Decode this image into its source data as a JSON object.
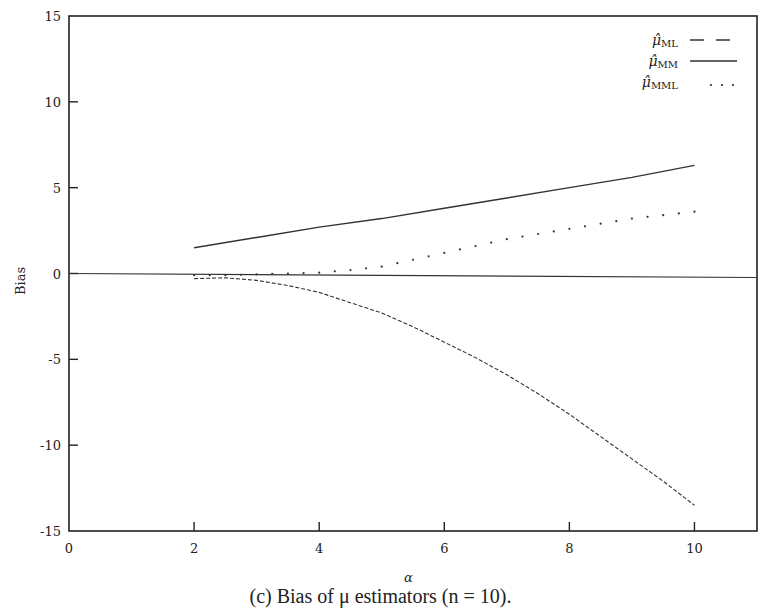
{
  "chart_data": {
    "type": "line",
    "title": "",
    "caption": "(c) Bias of μ estimators (n = 10).",
    "xlabel": "α",
    "ylabel": "Bias",
    "xlim": [
      0,
      11
    ],
    "ylim": [
      -15,
      15
    ],
    "xticks": [
      0,
      2,
      4,
      6,
      8,
      10
    ],
    "yticks": [
      15,
      10,
      5,
      0,
      -5,
      -10,
      -15
    ],
    "grid": false,
    "legend_position": "top-right",
    "reference_line": {
      "y": 0,
      "style": "solid"
    },
    "series": [
      {
        "name": "μ̂_ML",
        "label_base": "μ̂",
        "label_sub": "ML",
        "style": "dashed",
        "x": [
          2,
          2.5,
          3,
          3.5,
          4,
          4.5,
          5,
          5.5,
          6,
          6.5,
          7,
          7.5,
          8,
          8.5,
          9,
          9.5,
          10
        ],
        "values": [
          -0.3,
          -0.25,
          -0.4,
          -0.7,
          -1.1,
          -1.7,
          -2.3,
          -3.1,
          -4.0,
          -4.9,
          -5.9,
          -7.0,
          -8.2,
          -9.5,
          -10.8,
          -12.1,
          -13.5
        ]
      },
      {
        "name": "μ̂_MM",
        "label_base": "μ̂",
        "label_sub": "MM",
        "style": "solid",
        "x": [
          2,
          3,
          4,
          5,
          6,
          7,
          8,
          9,
          10
        ],
        "values": [
          1.5,
          2.1,
          2.7,
          3.2,
          3.8,
          4.4,
          5.0,
          5.6,
          6.3
        ]
      },
      {
        "name": "μ̂_MML",
        "label_base": "μ̂",
        "label_sub": "MML",
        "style": "dotted",
        "x": [
          2,
          2.5,
          3,
          3.5,
          4,
          4.5,
          5,
          5.5,
          6,
          6.5,
          7,
          7.5,
          8,
          8.5,
          9,
          9.5,
          10
        ],
        "values": [
          -0.1,
          -0.1,
          -0.05,
          0.0,
          0.05,
          0.2,
          0.4,
          0.8,
          1.2,
          1.6,
          2.0,
          2.3,
          2.6,
          2.9,
          3.2,
          3.4,
          3.6
        ]
      }
    ]
  }
}
